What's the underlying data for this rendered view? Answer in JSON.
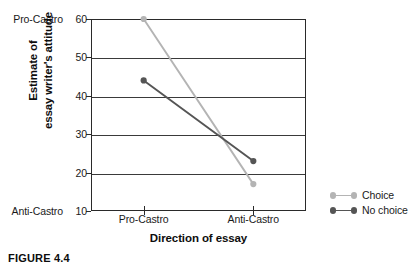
{
  "caption": "FIGURE 4.4",
  "chart_data": {
    "type": "line",
    "title": "",
    "xlabel": "Direction of essay",
    "ylabel": "Estimate of essay writer's attitude",
    "ylabel_line1": "Estimate of",
    "ylabel_line2": "essay writer's attitude",
    "categories": [
      "Pro-Castro",
      "Anti-Castro"
    ],
    "x": [
      "Pro-Castro",
      "Anti-Castro"
    ],
    "ylim": [
      10,
      60
    ],
    "yticks": [
      10,
      20,
      30,
      40,
      50,
      60
    ],
    "ytick_labels": [
      "10",
      "20",
      "30",
      "40",
      "50",
      "60"
    ],
    "y_anchor_high": "Pro-Castro",
    "y_anchor_low": "Anti-Castro",
    "y_anchor_high_value": 60,
    "y_anchor_low_value": 10,
    "grid": true,
    "grid_axis": "y",
    "legend_position": "right",
    "series": [
      {
        "name": "Choice",
        "color": "#b4b4b4",
        "marker": "circle",
        "values": [
          60,
          17
        ]
      },
      {
        "name": "No choice",
        "color": "#555555",
        "marker": "circle",
        "values": [
          44,
          23
        ]
      }
    ]
  },
  "legend": {
    "items": [
      {
        "label": "Choice",
        "color": "#b4b4b4"
      },
      {
        "label": "No choice",
        "color": "#555555"
      }
    ]
  },
  "colors": {
    "choice": "#b4b4b4",
    "no_choice": "#555555",
    "axis": "#2a2a2a",
    "grid": "#3a3a3a",
    "text": "#1a1a1a",
    "background": "#ffffff"
  }
}
